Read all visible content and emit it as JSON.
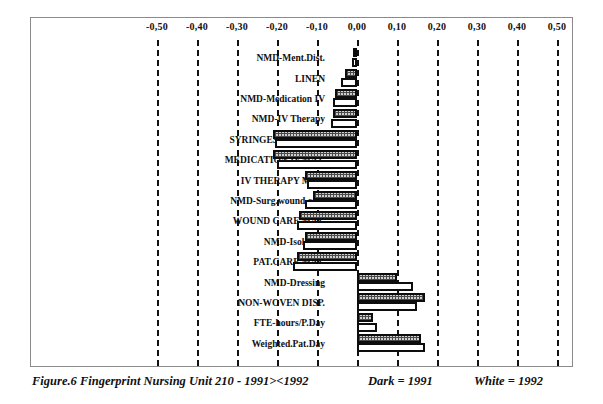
{
  "caption": {
    "title": "Figure.6 Fingerprint Nursing Unit 210 - 1991><1992",
    "legend_dark": "Dark = 1991",
    "legend_white": "White = 1992"
  },
  "chart_data": {
    "type": "bar",
    "orientation": "horizontal",
    "title": "Figure.6 Fingerprint Nursing Unit 210 - 1991><1992",
    "xlabel": "",
    "ylabel": "",
    "xlim": [
      -0.5,
      0.5
    ],
    "grid": true,
    "grid_axis": "x",
    "legend_position": "below-right",
    "decimal_separator": ",",
    "tick_labels": [
      "-0,50",
      "-0,40",
      "-0,30",
      "-0,20",
      "-0,10",
      "0,00",
      "0,10",
      "0,20",
      "0,30",
      "0,40",
      "0,50"
    ],
    "ticks": [
      -0.5,
      -0.4,
      -0.3,
      -0.2,
      -0.1,
      0.0,
      0.1,
      0.2,
      0.3,
      0.4,
      0.5
    ],
    "categories": [
      "NMD-Ment.Dist.",
      "LINEN",
      "NMD-Medication IV",
      "NMD-IV Therapy",
      "SYRINGES/NEEDLES",
      "MEDICATION IV.MAT.",
      "IV THERAPY MAT.",
      "NMD-Surg.wound care",
      "WOUND CARE MAT.",
      "NMD-Isolation",
      "PAT.CARE MAT.",
      "NMD-Dressing",
      "NON-WOVEN DISP.",
      "FTE-hours/P.Day",
      "Weighted.Pat.Day"
    ],
    "series": [
      {
        "name": "Dark = 1991",
        "fill": "dark",
        "values": [
          -0.01,
          -0.03,
          -0.055,
          -0.06,
          -0.21,
          -0.21,
          -0.13,
          -0.11,
          -0.145,
          -0.13,
          -0.15,
          0.1,
          0.17,
          0.04,
          0.16
        ]
      },
      {
        "name": "White = 1992",
        "fill": "white",
        "values": [
          -0.012,
          -0.04,
          -0.06,
          -0.065,
          -0.205,
          -0.2,
          -0.125,
          -0.13,
          -0.15,
          -0.135,
          -0.16,
          0.14,
          0.15,
          0.05,
          0.17
        ]
      }
    ]
  }
}
